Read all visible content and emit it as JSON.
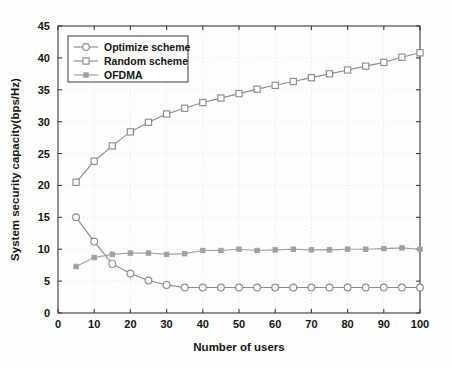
{
  "chart_data": {
    "type": "line",
    "title": "",
    "xlabel": "Number of users",
    "ylabel": "System security capacity(bps/Hz)",
    "xlim": [
      0,
      100
    ],
    "ylim": [
      0,
      45
    ],
    "xticks": [
      0,
      10,
      20,
      30,
      40,
      50,
      60,
      70,
      80,
      90,
      100
    ],
    "yticks": [
      0,
      5,
      10,
      15,
      20,
      25,
      30,
      35,
      40,
      45
    ],
    "grid": true,
    "legend_position": "upper left",
    "x": [
      5,
      10,
      15,
      20,
      25,
      30,
      35,
      40,
      45,
      50,
      55,
      60,
      65,
      70,
      75,
      80,
      85,
      90,
      95,
      100
    ],
    "series": [
      {
        "name": "Optimize scheme",
        "marker": "open-circle",
        "color": "#8c8c8c",
        "values": [
          15.0,
          11.2,
          7.7,
          6.2,
          5.1,
          4.4,
          4.0,
          4.0,
          4.0,
          4.0,
          4.0,
          4.0,
          4.0,
          4.0,
          4.0,
          4.0,
          4.0,
          4.0,
          4.0,
          4.0
        ]
      },
      {
        "name": "Random scheme",
        "marker": "open-square",
        "color": "#8c8c8c",
        "values": [
          20.5,
          23.8,
          26.2,
          28.4,
          29.9,
          31.2,
          32.1,
          33.0,
          33.7,
          34.4,
          35.1,
          35.7,
          36.3,
          36.9,
          37.5,
          38.1,
          38.7,
          39.3,
          40.1,
          40.8
        ]
      },
      {
        "name": "OFDMA",
        "marker": "filled-square",
        "color": "#a0a0a0",
        "values": [
          7.3,
          8.7,
          9.2,
          9.4,
          9.4,
          9.2,
          9.3,
          9.8,
          9.8,
          10.0,
          9.8,
          9.9,
          10.0,
          9.9,
          9.9,
          10.0,
          10.0,
          10.1,
          10.2,
          10.0
        ]
      }
    ]
  },
  "legend": {
    "entries": [
      {
        "label": "Optimize scheme"
      },
      {
        "label": "Random scheme"
      },
      {
        "label": "OFDMA"
      }
    ]
  },
  "axes": {
    "x_title": "Number of users",
    "y_title": "System security capacity(bps/Hz)",
    "x_tick_labels": [
      "0",
      "10",
      "20",
      "30",
      "40",
      "50",
      "60",
      "70",
      "80",
      "90",
      "100"
    ],
    "y_tick_labels": [
      "0",
      "5",
      "10",
      "15",
      "20",
      "25",
      "30",
      "35",
      "40",
      "45"
    ]
  },
  "colors": {
    "frame": "#3a3a3a",
    "grid": "#d9d9d9",
    "optimize": "#8c8c8c",
    "random": "#8c8c8c",
    "ofdma": "#a0a0a0",
    "background": "#fdfdfc"
  }
}
